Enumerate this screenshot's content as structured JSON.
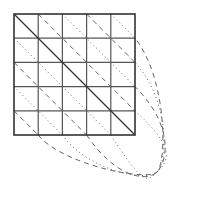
{
  "diagram": {
    "type": "grid-torus-diagonals",
    "grid": {
      "rows": 5,
      "cols": 5,
      "x0": 14,
      "y0": 14,
      "cell": 24.2
    },
    "main_diagonal": {
      "style": "solid"
    },
    "upper_diagonals": [
      {
        "offset": 1,
        "style": "dashed"
      },
      {
        "offset": 2,
        "style": "dotted"
      },
      {
        "offset": 3,
        "style": "dashed"
      },
      {
        "offset": 4,
        "style": "dotted"
      }
    ],
    "lower_diagonals": [
      {
        "offset": 1,
        "style": "dotted"
      },
      {
        "offset": 2,
        "style": "dashed"
      },
      {
        "offset": 3,
        "style": "dotted"
      },
      {
        "offset": 4,
        "style": "dashed"
      }
    ],
    "colors": {
      "grid": "#555555",
      "border": "#333333",
      "lines": "#666666"
    }
  }
}
